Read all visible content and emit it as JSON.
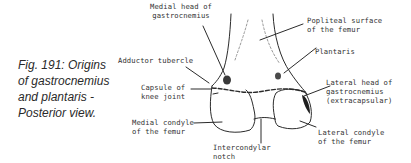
{
  "figure": {
    "caption_lines": [
      "Fig. 191:  Origins",
      "of gastrocnemius",
      "and plantaris -",
      "Posterior  view."
    ]
  },
  "labels": {
    "medial_head": [
      "Medial head of",
      "gastrocnemius"
    ],
    "adductor_tubercle": [
      "Adductor tubercle"
    ],
    "capsule": [
      "Capsule of",
      "knee joint"
    ],
    "medial_condyle": [
      "Medial condyle",
      "of the femur"
    ],
    "intercondylar": [
      "Intercondylar",
      "notch"
    ],
    "popliteal": [
      "Popliteal surface",
      "of the femur"
    ],
    "plantaris": [
      "Plantaris"
    ],
    "lateral_head": [
      "Lateral head of",
      "gastrocnemius",
      "(extracapsular)"
    ],
    "lateral_condyle": [
      "Lateral condyle",
      "of the femur"
    ]
  },
  "colors": {
    "line": "#2b2b2b",
    "caption": "#2a2a2a"
  }
}
